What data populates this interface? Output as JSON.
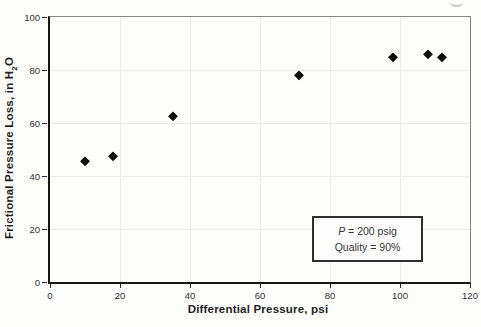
{
  "chart_data": {
    "type": "scatter",
    "title": "",
    "xlabel": "Differential Pressure, psi",
    "ylabel": "Frictional Pressure Loss, in H2O",
    "ylabel_parts": {
      "pre": "Frictional Pressure Loss, in H",
      "sub": "2",
      "post": "O"
    },
    "xlim": [
      0,
      120
    ],
    "ylim": [
      0,
      100
    ],
    "x_ticks": [
      0,
      20,
      40,
      60,
      80,
      100,
      120
    ],
    "y_ticks": [
      0,
      20,
      40,
      60,
      80,
      100
    ],
    "grid": true,
    "marker": "diamond",
    "points": [
      {
        "x": 10,
        "y": 45.5
      },
      {
        "x": 18,
        "y": 47.5
      },
      {
        "x": 35,
        "y": 62.5
      },
      {
        "x": 71,
        "y": 78
      },
      {
        "x": 98,
        "y": 85
      },
      {
        "x": 108,
        "y": 86
      },
      {
        "x": 112,
        "y": 85
      }
    ],
    "annotation": {
      "line1_var": "P",
      "line1_rest": " = 200 psig",
      "line2": "Quality = 90%"
    },
    "legend_position": "inside-lower-right"
  },
  "colors": {
    "axis": "#161616",
    "frame": "#878787",
    "grid": "#ececea",
    "text": "#2a2a2a",
    "marker": "#0b0b0b"
  }
}
